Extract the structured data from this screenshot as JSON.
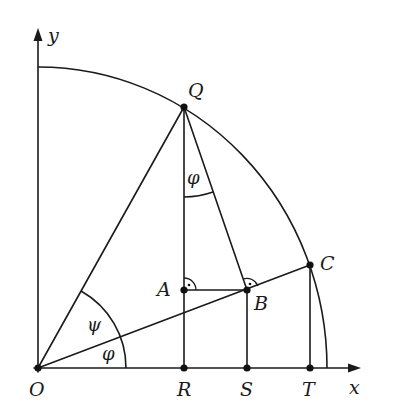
{
  "diagram": {
    "title": "",
    "axes": {
      "x_label": "x",
      "y_label": "y"
    },
    "points": {
      "O": {
        "label": "O",
        "x": 38,
        "y": 368
      },
      "Q": {
        "label": "Q",
        "x": 184,
        "y": 107
      },
      "A": {
        "label": "A",
        "x": 184,
        "y": 290
      },
      "B": {
        "label": "B",
        "x": 247,
        "y": 290
      },
      "C": {
        "label": "C",
        "x": 310,
        "y": 265
      },
      "R": {
        "label": "R",
        "x": 184,
        "y": 368
      },
      "S": {
        "label": "S",
        "x": 247,
        "y": 368
      },
      "T": {
        "label": "T",
        "x": 310,
        "y": 368
      }
    },
    "angles": {
      "psi": {
        "label": "ψ",
        "vertex": "O",
        "between": [
          "OC",
          "OQ"
        ]
      },
      "phi_O": {
        "label": "φ",
        "vertex": "O",
        "between": [
          "Ox",
          "OC"
        ]
      },
      "phi_Q": {
        "label": "φ",
        "vertex": "Q",
        "between": [
          "QR",
          "QB"
        ]
      }
    },
    "right_angles": [
      {
        "vertex": "A",
        "between": [
          "AQ",
          "AB"
        ]
      },
      {
        "vertex": "B",
        "between": [
          "BQ",
          "BC"
        ]
      }
    ],
    "segments": [
      "OQ",
      "OC",
      "QR",
      "QB",
      "AB",
      "BS",
      "CT"
    ],
    "arcs": [
      "quarter circle centered at O through Q and C",
      "arc QC"
    ]
  }
}
